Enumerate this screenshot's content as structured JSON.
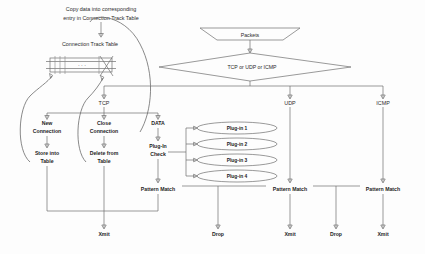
{
  "diagram": {
    "caption": {
      "line1": "Copy data into corresponding",
      "line2": "entry in Connection Track Table"
    },
    "table": {
      "label": "Connection Track Table"
    },
    "input": {
      "packets": "Packets",
      "classifier": "TCP  or  UDP  or  ICMP"
    },
    "protocols": {
      "tcp": "TCP",
      "udp": "UDP",
      "icmp": "ICMP"
    },
    "tcp_branches": [
      {
        "line1": "New",
        "line2": "Connection"
      },
      {
        "line1": "Close",
        "line2": "Connection"
      },
      {
        "line1": "DATA",
        "line2": ""
      }
    ],
    "tcp_actions": [
      {
        "line1": "Store into",
        "line2": "Table"
      },
      {
        "line1": "Delete from",
        "line2": "Table"
      },
      {
        "line1": "Plug-In",
        "line2": "Check"
      }
    ],
    "plugins": [
      {
        "label": "Plug-in 1"
      },
      {
        "label": "Plug-in 2"
      },
      {
        "label": "Plug-in 3"
      },
      {
        "label": "Plug-in 4"
      }
    ],
    "pattern_match": {
      "tcp": "Pattern Match",
      "udp": "Pattern Match",
      "icmp": "Pattern Match"
    },
    "terminals": {
      "tcp_xmit": "Xmit",
      "drop_1": "Drop",
      "udp_xmit": "Xmit",
      "drop_2": "Drop",
      "icmp_xmit": "Xmit"
    },
    "colors": {
      "line": "#6f6f6f",
      "text": "#2b2b2b",
      "background": "#fdfdfd"
    }
  }
}
